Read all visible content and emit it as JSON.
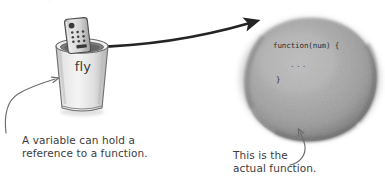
{
  "page": {
    "background_color": "#ffffff",
    "width": 385,
    "height": 183,
    "top_cropped_sliver": "."
  },
  "variable_cup": {
    "label": "fly",
    "icon": "remote-control-icon",
    "description": "paper cup holding a TV remote control, representing a variable holding a reference"
  },
  "function_blob": {
    "color": "#9a9a9a",
    "code_lines": [
      "function(num) {",
      "...",
      "}"
    ],
    "signature": "function(num) {",
    "body": "...",
    "closing_brace": "}"
  },
  "arrows": {
    "reference_arrow": {
      "name": "reference-arrow",
      "from": "variable-cup",
      "to": "function-blob",
      "color": "#252525"
    },
    "left_pointer": {
      "name": "caption-pointer-left",
      "color": "#6d6d6d"
    },
    "right_pointer": {
      "name": "caption-pointer-right",
      "color": "#6d6d6d"
    }
  },
  "captions": {
    "left": "A variable can hold a\nreference to a function.",
    "right": "This is the\nactual function."
  }
}
